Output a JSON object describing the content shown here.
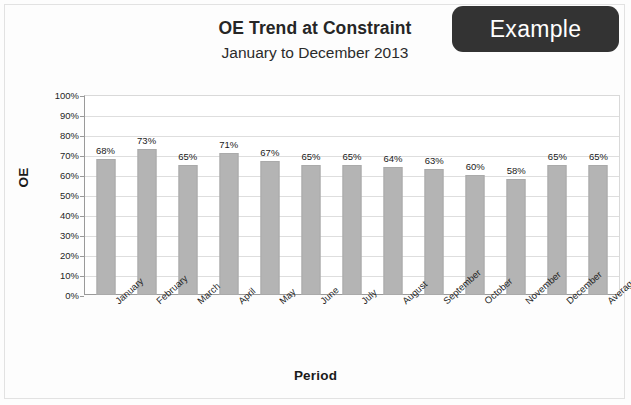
{
  "badge": {
    "label": "Example"
  },
  "header": {
    "title": "OE Trend at Constraint",
    "subtitle": "January to December 2013"
  },
  "chart_data": {
    "type": "bar",
    "title": "OE Trend at Constraint",
    "subtitle": "January to December 2013",
    "xlabel": "Period",
    "ylabel": "OE",
    "ylim": [
      0,
      100
    ],
    "ytick_labels": [
      "100%",
      "90%",
      "80%",
      "70%",
      "60%",
      "50%",
      "40%",
      "30%",
      "20%",
      "10%",
      "0%"
    ],
    "yticks": [
      100,
      90,
      80,
      70,
      60,
      50,
      40,
      30,
      20,
      10,
      0
    ],
    "grid": true,
    "legend": "none",
    "bar_color": "#b4b4b4",
    "categories": [
      "January",
      "February",
      "March",
      "April",
      "May",
      "June",
      "July",
      "August",
      "September",
      "October",
      "November",
      "December",
      "Average"
    ],
    "values": [
      68,
      73,
      65,
      71,
      67,
      65,
      65,
      64,
      63,
      60,
      58,
      65,
      65
    ],
    "value_labels": [
      "68%",
      "73%",
      "65%",
      "71%",
      "67%",
      "65%",
      "65%",
      "64%",
      "63%",
      "60%",
      "58%",
      "65%",
      "65%"
    ]
  }
}
